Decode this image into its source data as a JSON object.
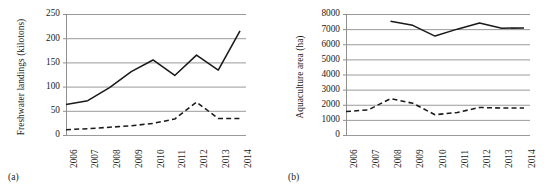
{
  "figure": {
    "panels": [
      {
        "caption": "(a)",
        "ylabel": "Freshwater landings (kilotons)"
      },
      {
        "caption": "(b)",
        "ylabel": "Aquaculture area (ha)"
      }
    ]
  },
  "chart_data": [
    {
      "type": "line",
      "panel": "(a)",
      "title": "",
      "xlabel": "",
      "ylabel": "Freshwater landings (kilotons)",
      "x": [
        2006,
        2007,
        2008,
        2009,
        2010,
        2011,
        2012,
        2013,
        2014
      ],
      "categories": [
        "2006",
        "2007",
        "2008",
        "2009",
        "2010",
        "2011",
        "2012",
        "2013",
        "2014"
      ],
      "ylim": [
        0,
        250
      ],
      "yticks": [
        0,
        50,
        100,
        150,
        200,
        250
      ],
      "ytick_labels": [
        "0",
        "50",
        "100",
        "150",
        "200",
        "250"
      ],
      "grid": "horizontal",
      "legend": "none",
      "series": [
        {
          "name": "solid",
          "style": "solid",
          "color": "#1a1a1a",
          "values": [
            63,
            71,
            98,
            131,
            155,
            123,
            165,
            134,
            215
          ]
        },
        {
          "name": "dashed",
          "style": "dashed",
          "color": "#1a1a1a",
          "values": [
            11,
            13,
            16,
            19,
            24,
            33,
            68,
            34,
            34
          ]
        }
      ]
    },
    {
      "type": "line",
      "panel": "(b)",
      "title": "",
      "xlabel": "",
      "ylabel": "Aquaculture area (ha)",
      "x": [
        2006,
        2007,
        2008,
        2009,
        2010,
        2011,
        2012,
        2013,
        2014
      ],
      "categories": [
        "2006",
        "2007",
        "2008",
        "2009",
        "2010",
        "2011",
        "2012",
        "2013",
        "2014"
      ],
      "ylim": [
        0,
        8000
      ],
      "yticks": [
        0,
        1000,
        2000,
        3000,
        4000,
        5000,
        6000,
        7000,
        8000
      ],
      "ytick_labels": [
        "0",
        "1000",
        "2000",
        "3000",
        "4000",
        "5000",
        "6000",
        "7000",
        "8000"
      ],
      "grid": "horizontal",
      "legend": "none",
      "series": [
        {
          "name": "solid",
          "style": "solid",
          "color": "#1a1a1a",
          "values": [
            null,
            null,
            7520,
            7250,
            6540,
            7000,
            7400,
            7060,
            7080
          ]
        },
        {
          "name": "dashed",
          "style": "dashed",
          "color": "#1a1a1a",
          "values": [
            1550,
            1660,
            2400,
            2100,
            1340,
            1490,
            1820,
            1780,
            1790
          ]
        }
      ]
    }
  ]
}
